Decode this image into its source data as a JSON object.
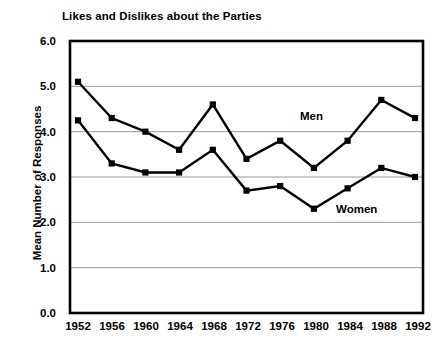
{
  "chart_data": {
    "type": "line",
    "title": "Likes and Dislikes about the Parties",
    "xlabel": "",
    "ylabel": "Mean Number of Responses",
    "categories": [
      "1952",
      "1956",
      "1960",
      "1964",
      "1968",
      "1972",
      "1976",
      "1980",
      "1984",
      "1988",
      "1992"
    ],
    "series": [
      {
        "name": "Men",
        "values": [
          5.1,
          4.3,
          4.0,
          3.6,
          4.6,
          3.4,
          3.8,
          3.2,
          3.8,
          4.7,
          4.3
        ],
        "marker": "square",
        "color": "#000000"
      },
      {
        "name": "Women",
        "values": [
          4.25,
          3.3,
          3.1,
          3.1,
          3.6,
          2.7,
          2.8,
          2.3,
          2.75,
          3.2,
          3.0
        ],
        "marker": "square",
        "color": "#000000"
      }
    ],
    "ylim": [
      0.0,
      6.0
    ],
    "y_ticks": [
      "0.0",
      "1.0",
      "2.0",
      "3.0",
      "4.0",
      "5.0",
      "6.0"
    ],
    "grid": true,
    "grid_axis": "y",
    "grid_color": "#999999",
    "legend": "inline-annotations",
    "annotations": [
      {
        "text": "Men",
        "x": "1980",
        "y": 4.35
      },
      {
        "text": "Women",
        "x": "1988",
        "y": 2.4
      }
    ]
  }
}
